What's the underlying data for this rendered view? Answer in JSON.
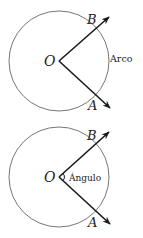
{
  "diagrams": [
    {
      "id": "arc",
      "center_label": "O",
      "point_b": "B",
      "point_a": "A",
      "annotation": "Arco"
    },
    {
      "id": "angle",
      "center_label": "O",
      "point_b": "B",
      "point_a": "A",
      "annotation": "Ángulo"
    }
  ],
  "colors": {
    "circle": "#777777",
    "rays": "#1a1a1a",
    "text": "#222222"
  }
}
